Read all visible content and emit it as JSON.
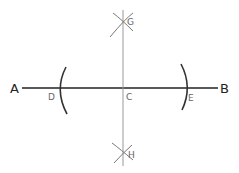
{
  "diagram": {
    "colors": {
      "background": "#ffffff",
      "main_line": "#222222",
      "bisector_line": "#888888",
      "arcs": "#333333"
    },
    "points": {
      "A": {
        "label": "A",
        "x": 15,
        "y": 92
      },
      "B": {
        "label": "B",
        "x": 227,
        "y": 92
      },
      "C": {
        "label": "C",
        "x": 126,
        "y": 100
      },
      "D": {
        "label": "D",
        "x": 50,
        "y": 100
      },
      "E": {
        "label": "E",
        "x": 188,
        "y": 101
      },
      "G": {
        "label": "G",
        "x": 126,
        "y": 25
      },
      "H": {
        "label": "H",
        "x": 126,
        "y": 157
      }
    }
  }
}
